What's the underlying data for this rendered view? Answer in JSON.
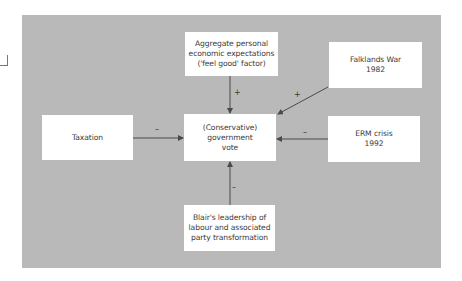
{
  "diagram": {
    "background_color": "#b9b9b9",
    "box_color": "#ffffff",
    "arrow_color": "#4a4a4a",
    "nodes": {
      "top": {
        "lines": [
          "Aggregate personal",
          "economic expectations",
          "('feel good' factor)"
        ]
      },
      "falklands": {
        "lines": [
          "Falklands War",
          "1982"
        ]
      },
      "taxation": {
        "lines": [
          "Taxation"
        ]
      },
      "center": {
        "lines": [
          "(Conservative)",
          "government",
          "vote"
        ]
      },
      "erm": {
        "lines": [
          "ERM crisis",
          "1992"
        ]
      },
      "blair": {
        "lines": [
          "Blair's leadership of",
          "labour and associated",
          "party transformation"
        ]
      }
    },
    "edges": [
      {
        "from": "top",
        "to": "center",
        "sign": "+"
      },
      {
        "from": "falklands",
        "to": "center",
        "sign": "+"
      },
      {
        "from": "taxation",
        "to": "center",
        "sign": "–"
      },
      {
        "from": "erm",
        "to": "center",
        "sign": "–"
      },
      {
        "from": "blair",
        "to": "center",
        "sign": "–"
      }
    ]
  }
}
